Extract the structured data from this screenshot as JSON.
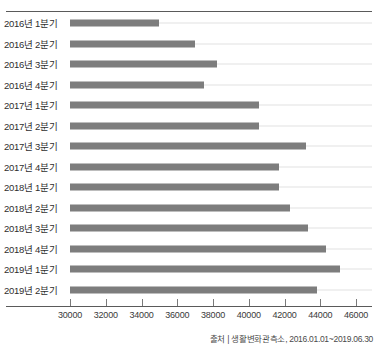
{
  "chart_data": {
    "type": "bar",
    "orientation": "horizontal",
    "title": "",
    "xlabel": "",
    "ylabel": "",
    "xlim": [
      30000,
      46000
    ],
    "xticks": [
      30000,
      32000,
      34000,
      36000,
      38000,
      40000,
      42000,
      44000,
      46000
    ],
    "xtick_labels": [
      "30000",
      "32000",
      "34000",
      "36000",
      "38000",
      "40000",
      "42000",
      "44000",
      "46000"
    ],
    "grid": true,
    "legend": false,
    "bar_color": "#7d7d7d",
    "categories": [
      "2016년 1분기",
      "2016년 2분기",
      "2016년 3분기",
      "2016년 4분기",
      "2017년 1분기",
      "2017년 2분기",
      "2017년 3분기",
      "2017년 4분기",
      "2018년 1분기",
      "2018년 2분기",
      "2018년 3분기",
      "2018년 4분기",
      "2019년 1분기",
      "2019년 2분기"
    ],
    "values": [
      35000,
      37000,
      38200,
      37500,
      40600,
      40600,
      43200,
      41700,
      41700,
      42300,
      43300,
      44300,
      45100,
      43800
    ]
  },
  "source": {
    "text": "출처 | 생활변화관측소, 2016.01.01~2019.06.30"
  }
}
